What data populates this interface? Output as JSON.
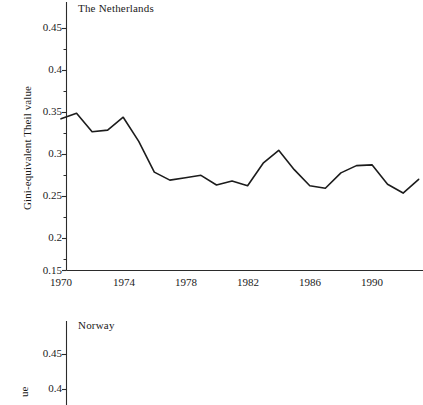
{
  "figure": {
    "background": "#ffffff",
    "line_color": "#1c1c1c",
    "axis_color": "#2b2b2b"
  },
  "panels": [
    {
      "name": "netherlands",
      "title": "The Netherlands",
      "ylabel": "Gini-equivalent Theil value",
      "ytick_labels": [
        "0.45",
        "0.4",
        "0.35",
        "0.3",
        "0.25",
        "0.2",
        "0.15"
      ],
      "xtick_labels": [
        "1970",
        "1974",
        "1978",
        "1982",
        "1986",
        "1990"
      ]
    },
    {
      "name": "norway",
      "title": "Norway",
      "ylabel_fragment": "ue",
      "ytick_labels": [
        "0.45",
        "0.4"
      ]
    }
  ],
  "chart_data": [
    {
      "type": "line",
      "title": "The Netherlands",
      "xlabel": "",
      "ylabel": "Gini-equivalent Theil value",
      "xlim": [
        1970,
        1993
      ],
      "ylim": [
        0.15,
        0.47
      ],
      "ytick_values": [
        0.45,
        0.4,
        0.35,
        0.3,
        0.25,
        0.2,
        0.15
      ],
      "yminor_step": 0.025,
      "xtick_values": [
        1970,
        1974,
        1978,
        1982,
        1986,
        1990
      ],
      "grid": false,
      "legend": "none",
      "series": [
        {
          "name": "The Netherlands",
          "x": [
            1970,
            1971,
            1972,
            1973,
            1974,
            1975,
            1976,
            1977,
            1978,
            1979,
            1980,
            1981,
            1982,
            1983,
            1984,
            1985,
            1986,
            1987,
            1988,
            1989,
            1990,
            1991,
            1992,
            1993
          ],
          "values": [
            0.338,
            0.345,
            0.322,
            0.324,
            0.34,
            0.31,
            0.272,
            0.262,
            0.265,
            0.268,
            0.256,
            0.261,
            0.255,
            0.283,
            0.299,
            0.275,
            0.255,
            0.252,
            0.271,
            0.28,
            0.281,
            0.257,
            0.246,
            0.263
          ]
        }
      ]
    },
    {
      "type": "line",
      "title": "Norway",
      "xlabel": "",
      "ylabel": "Gini-equivalent Theil value",
      "ylim": [
        0.38,
        0.47
      ],
      "ytick_values": [
        0.45,
        0.4
      ],
      "grid": false,
      "legend": "none",
      "note": "panel cropped at bottom of image — no data line visible",
      "series": []
    }
  ]
}
